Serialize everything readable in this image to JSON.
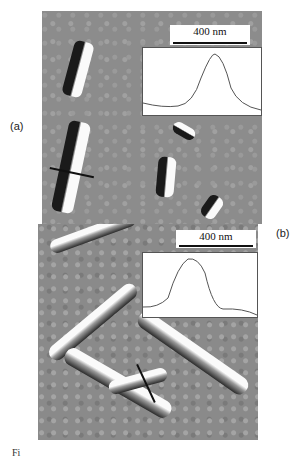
{
  "figure": {
    "panels": [
      {
        "id": "a",
        "label": "(a)",
        "scale_bar": "400 nm",
        "inset": "height profile across single nanorod"
      },
      {
        "id": "b",
        "label": "(b)",
        "scale_bar": "400 nm",
        "inset": "height profile across nanorod bundle"
      }
    ],
    "caption_fragment": "Fi"
  }
}
